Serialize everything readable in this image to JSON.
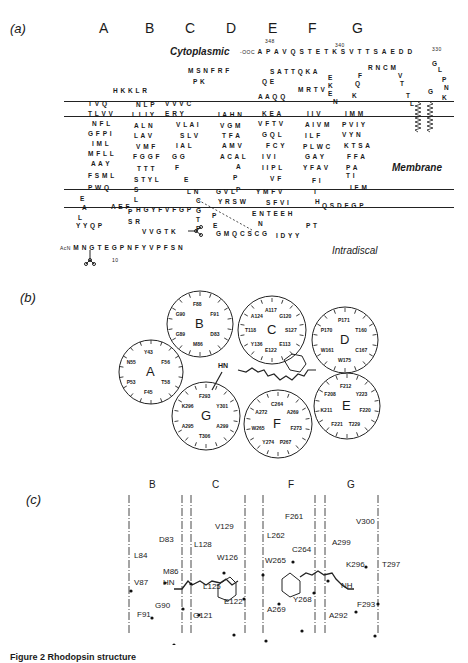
{
  "figure": {
    "caption": "Figure 2 Rhodopsin structure",
    "panels": {
      "a": {
        "label": "(a)",
        "helix_letters": [
          "A",
          "B",
          "C",
          "D",
          "E",
          "F",
          "G"
        ],
        "regions": {
          "cytoplasmic": "Cytoplasmic",
          "membrane": "Membrane",
          "intradiscal": "Intradiscal"
        },
        "c_terminus": {
          "label": "-OOC",
          "sequence": "APAVQSTETKSVTTSAEDD",
          "numbers": [
            "348",
            "340",
            "330"
          ]
        },
        "n_terminus": {
          "label": "AcN",
          "sequence": "MNGTEGPNFYVPFSN",
          "numbers": [
            "10"
          ]
        },
        "residue_numbers": [
          "10",
          "20",
          "30",
          "40",
          "50",
          "60",
          "70",
          "80",
          "90",
          "100",
          "110",
          "120",
          "130",
          "140",
          "150",
          "160",
          "170",
          "180",
          "187",
          "190",
          "200",
          "210",
          "220",
          "230",
          "240",
          "250",
          "260",
          "270",
          "280",
          "290",
          "300",
          "310",
          "320",
          "330",
          "340",
          "348"
        ],
        "rows": [
          {
            "x": 113,
            "y": 87,
            "text": "H K K L R"
          },
          {
            "x": 88,
            "y": 100,
            "text": "T V Q"
          },
          {
            "x": 88,
            "y": 110,
            "text": "T L V V"
          },
          {
            "x": 92,
            "y": 120,
            "text": "N F L"
          },
          {
            "x": 88,
            "y": 130,
            "text": "G F P I"
          },
          {
            "x": 92,
            "y": 140,
            "text": "I M L"
          },
          {
            "x": 88,
            "y": 150,
            "text": "M F L L"
          },
          {
            "x": 91,
            "y": 160,
            "text": "A A Y"
          },
          {
            "x": 88,
            "y": 172,
            "text": "F S M L"
          },
          {
            "x": 88,
            "y": 184,
            "text": "P W Q"
          },
          {
            "x": 80,
            "y": 195,
            "text": "E"
          },
          {
            "x": 82,
            "y": 204,
            "text": "A"
          },
          {
            "x": 78,
            "y": 214,
            "text": "L"
          },
          {
            "x": 76,
            "y": 222,
            "text": "Y Y Q P"
          },
          {
            "x": 111,
            "y": 203,
            "text": "A E F"
          },
          {
            "x": 128,
            "y": 208,
            "text": "P"
          },
          {
            "x": 136,
            "y": 101,
            "text": "N L P"
          },
          {
            "x": 132,
            "y": 111,
            "text": "L L I Y"
          },
          {
            "x": 134,
            "y": 122,
            "text": "A L N"
          },
          {
            "x": 134,
            "y": 132,
            "text": "L A V"
          },
          {
            "x": 136,
            "y": 143,
            "text": "V M F"
          },
          {
            "x": 133,
            "y": 153,
            "text": "F G G F"
          },
          {
            "x": 137,
            "y": 165,
            "text": "T T T"
          },
          {
            "x": 134,
            "y": 176,
            "text": "S T Y L"
          },
          {
            "x": 134,
            "y": 186,
            "text": "S"
          },
          {
            "x": 134,
            "y": 196,
            "text": "L"
          },
          {
            "x": 136,
            "y": 206,
            "text": "H G Y F V F G P"
          },
          {
            "x": 128,
            "y": 218,
            "text": "S R"
          },
          {
            "x": 142,
            "y": 228,
            "text": "V V G T K"
          },
          {
            "x": 165,
            "y": 100,
            "text": "V V V C"
          },
          {
            "x": 165,
            "y": 110,
            "text": "E R Y"
          },
          {
            "x": 176,
            "y": 121,
            "text": "V L A I"
          },
          {
            "x": 180,
            "y": 132,
            "text": "S L V"
          },
          {
            "x": 176,
            "y": 142,
            "text": "I A L"
          },
          {
            "x": 172,
            "y": 153,
            "text": "G G"
          },
          {
            "x": 175,
            "y": 164,
            "text": "F"
          },
          {
            "x": 184,
            "y": 176,
            "text": "E"
          },
          {
            "x": 187,
            "y": 188,
            "text": "L N"
          },
          {
            "x": 196,
            "y": 197,
            "text": "C"
          },
          {
            "x": 196,
            "y": 207,
            "text": "G"
          },
          {
            "x": 196,
            "y": 216,
            "text": "T"
          },
          {
            "x": 196,
            "y": 225,
            "text": "P"
          },
          {
            "x": 188,
            "y": 67,
            "text": "M S N F R F"
          },
          {
            "x": 193,
            "y": 78,
            "text": "P K"
          },
          {
            "x": 218,
            "y": 111,
            "text": "I A H N"
          },
          {
            "x": 220,
            "y": 122,
            "text": "V G M"
          },
          {
            "x": 222,
            "y": 132,
            "text": "T F A"
          },
          {
            "x": 222,
            "y": 142,
            "text": "A M V"
          },
          {
            "x": 220,
            "y": 153,
            "text": "A C A L"
          },
          {
            "x": 236,
            "y": 163,
            "text": "A"
          },
          {
            "x": 233,
            "y": 174,
            "text": "P"
          },
          {
            "x": 236,
            "y": 186,
            "text": "P"
          },
          {
            "x": 216,
            "y": 188,
            "text": "G V L"
          },
          {
            "x": 218,
            "y": 198,
            "text": "Y R S W"
          },
          {
            "x": 212,
            "y": 212,
            "text": "P"
          },
          {
            "x": 213,
            "y": 222,
            "text": "E"
          },
          {
            "x": 216,
            "y": 230,
            "text": "G M Q C S C G"
          },
          {
            "x": 258,
            "y": 93,
            "text": "A A Q Q"
          },
          {
            "x": 262,
            "y": 110,
            "text": "K E A"
          },
          {
            "x": 258,
            "y": 120,
            "text": "V F T V"
          },
          {
            "x": 262,
            "y": 131,
            "text": "G Q L"
          },
          {
            "x": 266,
            "y": 142,
            "text": "F C Y"
          },
          {
            "x": 262,
            "y": 153,
            "text": "I V I"
          },
          {
            "x": 262,
            "y": 164,
            "text": "I I P L"
          },
          {
            "x": 270,
            "y": 175,
            "text": "V F"
          },
          {
            "x": 256,
            "y": 188,
            "text": "Y M F V"
          },
          {
            "x": 266,
            "y": 199,
            "text": "S F V I"
          },
          {
            "x": 252,
            "y": 210,
            "text": "E N T E E H"
          },
          {
            "x": 258,
            "y": 220,
            "text": "N"
          },
          {
            "x": 276,
            "y": 232,
            "text": "I D Y Y"
          },
          {
            "x": 306,
            "y": 222,
            "text": "P T"
          },
          {
            "x": 262,
            "y": 78,
            "text": "Q E"
          },
          {
            "x": 270,
            "y": 68,
            "text": "S A T T Q K A"
          },
          {
            "x": 298,
            "y": 86,
            "text": "M R T V"
          },
          {
            "x": 307,
            "y": 110,
            "text": "I I V"
          },
          {
            "x": 305,
            "y": 121,
            "text": "A I V M"
          },
          {
            "x": 305,
            "y": 132,
            "text": "I L F"
          },
          {
            "x": 303,
            "y": 143,
            "text": "P L W C"
          },
          {
            "x": 305,
            "y": 153,
            "text": "G A Y"
          },
          {
            "x": 303,
            "y": 164,
            "text": "Y F A V"
          },
          {
            "x": 312,
            "y": 177,
            "text": "F I"
          },
          {
            "x": 313,
            "y": 188,
            "text": "T"
          },
          {
            "x": 315,
            "y": 198,
            "text": "H"
          },
          {
            "x": 322,
            "y": 202,
            "text": "Q S D F G P"
          },
          {
            "x": 328,
            "y": 74,
            "text": "E"
          },
          {
            "x": 328,
            "y": 82,
            "text": "K"
          },
          {
            "x": 328,
            "y": 90,
            "text": "E"
          },
          {
            "x": 333,
            "y": 98,
            "text": "N"
          },
          {
            "x": 345,
            "y": 110,
            "text": "I M M"
          },
          {
            "x": 342,
            "y": 121,
            "text": "P V I Y"
          },
          {
            "x": 342,
            "y": 131,
            "text": "V Y N"
          },
          {
            "x": 344,
            "y": 142,
            "text": "K T S A"
          },
          {
            "x": 347,
            "y": 153,
            "text": "F F A"
          },
          {
            "x": 346,
            "y": 164,
            "text": "P A"
          },
          {
            "x": 346,
            "y": 172,
            "text": "T I"
          },
          {
            "x": 350,
            "y": 184,
            "text": "I F M"
          },
          {
            "x": 352,
            "y": 92,
            "text": "K"
          },
          {
            "x": 355,
            "y": 80,
            "text": "Q"
          },
          {
            "x": 358,
            "y": 72,
            "text": "F"
          },
          {
            "x": 368,
            "y": 64,
            "text": "R N C M"
          },
          {
            "x": 398,
            "y": 72,
            "text": "V"
          },
          {
            "x": 400,
            "y": 80,
            "text": "T"
          },
          {
            "x": 406,
            "y": 92,
            "text": "T"
          },
          {
            "x": 410,
            "y": 100,
            "text": "L"
          },
          {
            "x": 428,
            "y": 88,
            "text": "G"
          },
          {
            "x": 442,
            "y": 94,
            "text": "K"
          },
          {
            "x": 444,
            "y": 84,
            "text": "N"
          },
          {
            "x": 442,
            "y": 76,
            "text": "P"
          },
          {
            "x": 438,
            "y": 66,
            "text": "L"
          },
          {
            "x": 432,
            "y": 60,
            "text": "G"
          }
        ],
        "circled_residues": [
          "W",
          "E",
          "A",
          "F",
          "W",
          "H",
          "P",
          "W",
          "Y",
          "Y",
          "A",
          "E"
        ],
        "boxed_residues": [
          "K"
        ]
      },
      "b": {
        "label": "(b)",
        "wheels": [
          {
            "helix": "A",
            "residues": [
              "Y43",
              "F56",
              "T58",
              "F45",
              "P53",
              "N55"
            ]
          },
          {
            "helix": "B",
            "residues": [
              "F88",
              "F91",
              "D83",
              "M86",
              "G89",
              "G90"
            ]
          },
          {
            "helix": "C",
            "residues": [
              "A117",
              "G120",
              "S127",
              "E113",
              "E122",
              "Y136",
              "T118",
              "A124"
            ]
          },
          {
            "helix": "D",
            "residues": [
              "P171",
              "T160",
              "C167",
              "W175",
              "W161",
              "P170"
            ]
          },
          {
            "helix": "E",
            "residues": [
              "F212",
              "Y223",
              "F220",
              "T229",
              "F221",
              "K211",
              "F208"
            ]
          },
          {
            "helix": "F",
            "residues": [
              "C264",
              "A269",
              "F273",
              "P267",
              "Y274",
              "W265",
              "A272"
            ]
          },
          {
            "helix": "G",
            "residues": [
              "F293",
              "Y301",
              "A299",
              "T306",
              "A295",
              "K296"
            ]
          }
        ],
        "chromophore_label": "HN"
      },
      "c": {
        "label": "(c)",
        "helix_headers": [
          "B",
          "C",
          "F",
          "G"
        ],
        "points": [
          {
            "label": "D83",
            "helix": "B"
          },
          {
            "label": "L84",
            "helix": "B"
          },
          {
            "label": "M86",
            "helix": "B"
          },
          {
            "label": "V87",
            "helix": "B"
          },
          {
            "label": "G90",
            "helix": "B"
          },
          {
            "label": "F91",
            "helix": "B"
          },
          {
            "label": "V129",
            "helix": "C"
          },
          {
            "label": "L128",
            "helix": "C"
          },
          {
            "label": "W126",
            "helix": "C"
          },
          {
            "label": "L125",
            "helix": "C"
          },
          {
            "label": "E122",
            "helix": "C"
          },
          {
            "label": "G121",
            "helix": "C"
          },
          {
            "label": "F261",
            "helix": "F"
          },
          {
            "label": "L262",
            "helix": "F"
          },
          {
            "label": "C264",
            "helix": "F"
          },
          {
            "label": "W265",
            "helix": "F"
          },
          {
            "label": "Y268",
            "helix": "F"
          },
          {
            "label": "A269",
            "helix": "F"
          },
          {
            "label": "V300",
            "helix": "G"
          },
          {
            "label": "A299",
            "helix": "G"
          },
          {
            "label": "K296",
            "helix": "G"
          },
          {
            "label": "T297",
            "helix": "G"
          },
          {
            "label": "F293",
            "helix": "G"
          },
          {
            "label": "A292",
            "helix": "G"
          }
        ],
        "schiff_base_labels": [
          "HN",
          "NH"
        ]
      }
    }
  }
}
